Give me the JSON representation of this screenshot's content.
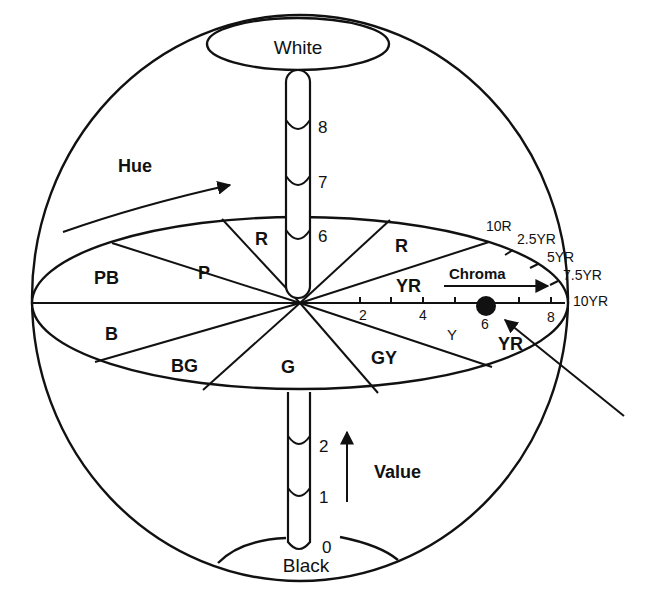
{
  "figure": {
    "poles": {
      "top": "White",
      "bottom": "Black"
    },
    "value_scale": {
      "label": "Value",
      "upper_ticks": [
        "8",
        "7",
        "6"
      ],
      "lower_ticks": [
        "2",
        "1",
        "0"
      ]
    },
    "hue": {
      "label": "Hue",
      "sectors": [
        "PB",
        "P",
        "R",
        "R",
        "YR",
        "B",
        "BG",
        "G",
        "GY",
        "Y",
        "YR"
      ]
    },
    "chroma": {
      "label": "Chroma",
      "ticks": [
        "2",
        "4",
        "6",
        "8"
      ]
    },
    "hue_steps": [
      "10R",
      "2.5YR",
      "5YR",
      "7.5YR",
      "10YR"
    ],
    "sample_point": {
      "chroma": "6",
      "hue": "YR"
    },
    "caption_cropped": ""
  },
  "colors": {
    "line": "#111111",
    "background": "#ffffff"
  }
}
